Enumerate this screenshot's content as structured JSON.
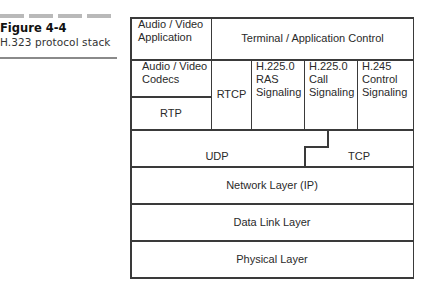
{
  "figure": {
    "number": "Figure 4-4",
    "caption": "H.323 protocol stack"
  },
  "stack": {
    "top_row": {
      "av_application": [
        "Audio / Video",
        "Application"
      ],
      "terminal_control": "Terminal / Application Control"
    },
    "second_row": {
      "av_codecs": [
        "Audio / Video",
        "Codecs"
      ],
      "rtp": "RTP",
      "rtcp": "RTCP",
      "h225_ras": [
        "H.225.0",
        "RAS",
        "Signaling"
      ],
      "h225_call": [
        "H.225.0",
        "Call",
        "Signaling"
      ],
      "h245": [
        "H.245",
        "Control",
        "Signaling"
      ]
    },
    "transport": {
      "udp": "UDP",
      "tcp": "TCP"
    },
    "network": "Network Layer (IP)",
    "data_link": "Data Link Layer",
    "physical": "Physical Layer"
  },
  "colors": {
    "line": "#3a3a3a",
    "text": "#2a2a2a",
    "accent_bar": "#b9b9b9"
  }
}
